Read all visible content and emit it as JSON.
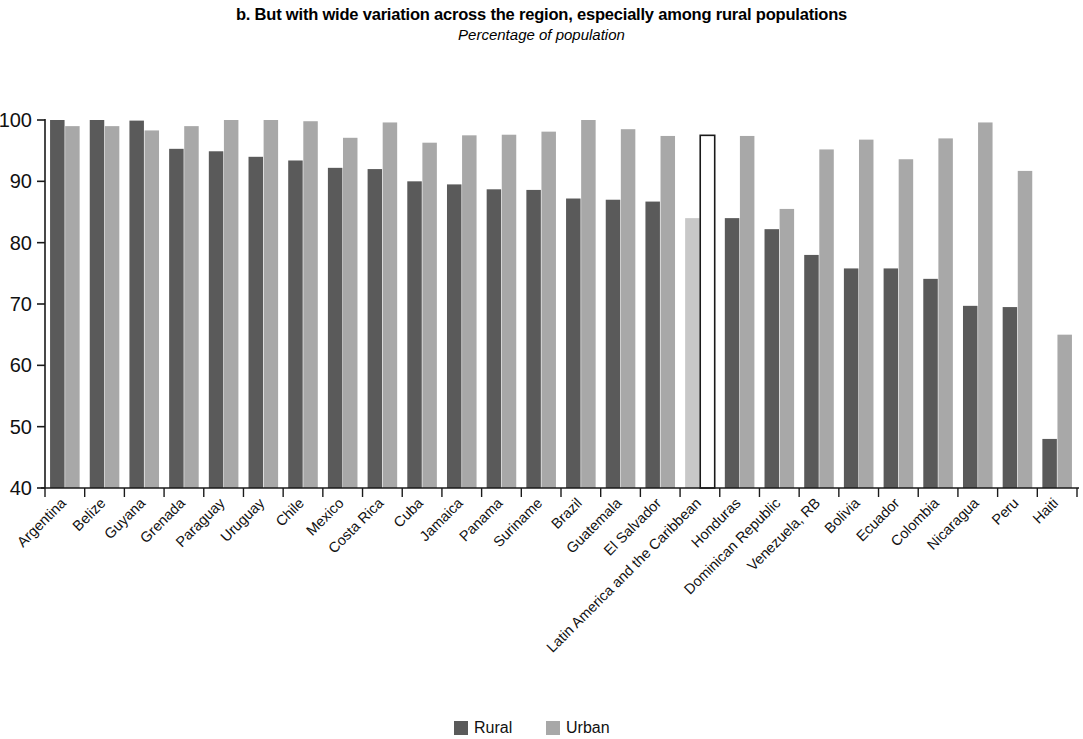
{
  "chart_data": {
    "type": "bar",
    "title": "b. But with wide variation across the region, especially among rural populations",
    "subtitle": "Percentage of population",
    "xlabel": "",
    "ylabel": "",
    "ylim": [
      40,
      100
    ],
    "ytick_step": 10,
    "yticks": [
      40,
      50,
      60,
      70,
      80,
      90,
      100
    ],
    "grid": false,
    "legend_position": "bottom",
    "highlight_category": "Latin America and the Caribbean",
    "categories": [
      "Argentina",
      "Belize",
      "Guyana",
      "Grenada",
      "Paraguay",
      "Uruguay",
      "Chile",
      "Mexico",
      "Costa Rica",
      "Cuba",
      "Jamaica",
      "Panama",
      "Suriname",
      "Brazil",
      "Guatemala",
      "El Salvador",
      "Latin America and the Caribbean",
      "Honduras",
      "Dominican Republic",
      "Venezuela, RB",
      "Bolivia",
      "Ecuador",
      "Colombia",
      "Nicaragua",
      "Peru",
      "Haiti"
    ],
    "series": [
      {
        "name": "Rural",
        "color": "#5a5a5a",
        "values": [
          100,
          100,
          99.9,
          95.3,
          94.9,
          94.0,
          93.4,
          92.2,
          92.0,
          90.0,
          89.5,
          88.7,
          88.6,
          87.2,
          87.0,
          86.7,
          84.0,
          84.0,
          82.2,
          78.0,
          75.8,
          75.8,
          74.1,
          69.7,
          69.5,
          48.0
        ]
      },
      {
        "name": "Urban",
        "color": "#a8a8a8",
        "values": [
          99.0,
          99.0,
          98.3,
          99.0,
          100,
          100,
          99.8,
          97.1,
          99.6,
          96.3,
          97.5,
          97.6,
          98.1,
          100,
          98.5,
          97.4,
          97.5,
          97.4,
          85.5,
          95.2,
          96.8,
          93.6,
          97.0,
          99.6,
          91.7,
          65.0
        ]
      }
    ]
  },
  "legend": {
    "items": [
      {
        "label": "Rural",
        "color": "#5a5a5a"
      },
      {
        "label": "Urban",
        "color": "#a8a8a8"
      }
    ]
  },
  "colors": {
    "rural": "#5a5a5a",
    "urban": "#a8a8a8",
    "highlight_rural": "#c8c8c8",
    "highlight_urban_fill": "#ffffff",
    "highlight_urban_stroke": "#1a1a1a",
    "axis": "#1a1a1a",
    "background": "#ffffff"
  }
}
